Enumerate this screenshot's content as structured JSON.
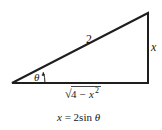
{
  "diagram": {
    "type": "right-triangle",
    "hypotenuse_label": "2",
    "opposite_label": "x",
    "angle_label": "θ",
    "adjacent_label": {
      "radical": "√",
      "radicand_prefix": "4 − ",
      "radicand_var": "x",
      "radicand_exp": "2"
    },
    "caption": {
      "lhs": "x",
      "eq": " = 2sin ",
      "angle": "θ"
    }
  }
}
